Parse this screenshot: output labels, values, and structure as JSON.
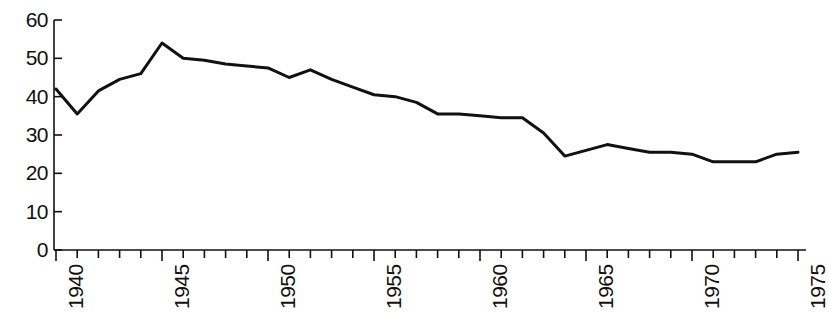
{
  "chart_data": {
    "type": "line",
    "title": "",
    "subtitle": "",
    "xlabel": "",
    "ylabel": "",
    "xlim": [
      1940,
      1975
    ],
    "ylim": [
      0,
      60
    ],
    "grid": false,
    "legend": null,
    "y_ticks": [
      0,
      10,
      20,
      30,
      40,
      50,
      60
    ],
    "y_tick_labels": [
      "0",
      "10",
      "20",
      "30",
      "40",
      "50",
      "60"
    ],
    "x_ticks": [
      1940,
      1941,
      1942,
      1943,
      1944,
      1945,
      1946,
      1947,
      1948,
      1949,
      1950,
      1951,
      1952,
      1953,
      1954,
      1955,
      1956,
      1957,
      1958,
      1959,
      1960,
      1961,
      1962,
      1963,
      1964,
      1965,
      1966,
      1967,
      1968,
      1969,
      1970,
      1971,
      1972,
      1973,
      1974,
      1975
    ],
    "x_major_ticks": [
      1940,
      1945,
      1950,
      1955,
      1960,
      1965,
      1970,
      1975
    ],
    "x_major_tick_labels": [
      "1940",
      "1945",
      "1950",
      "1955",
      "1960",
      "1965",
      "1970",
      "1975"
    ],
    "x_tick_label_rotation": 90,
    "line_color": "#111111",
    "line_width": 3,
    "background_color": "#ffffff",
    "axis_color": "#111111",
    "x": [
      1940,
      1941,
      1942,
      1943,
      1944,
      1945,
      1946,
      1947,
      1948,
      1949,
      1950,
      1951,
      1952,
      1953,
      1954,
      1955,
      1956,
      1957,
      1958,
      1959,
      1960,
      1961,
      1962,
      1963,
      1964,
      1965,
      1966,
      1967,
      1968,
      1969,
      1970,
      1971,
      1972,
      1973,
      1974,
      1975
    ],
    "values": [
      42.0,
      35.5,
      41.5,
      44.5,
      46.0,
      54.0,
      50.0,
      49.5,
      48.5,
      48.0,
      47.5,
      45.0,
      47.0,
      44.5,
      42.5,
      40.5,
      40.0,
      38.5,
      35.5,
      35.5,
      35.0,
      34.5,
      34.5,
      30.5,
      24.5,
      26.0,
      27.5,
      26.5,
      25.5,
      25.5,
      25.0,
      23.0,
      23.0,
      23.0,
      25.0,
      25.5
    ]
  },
  "axes": {
    "y_axis_name": "y-axis",
    "x_axis_name": "x-axis"
  }
}
